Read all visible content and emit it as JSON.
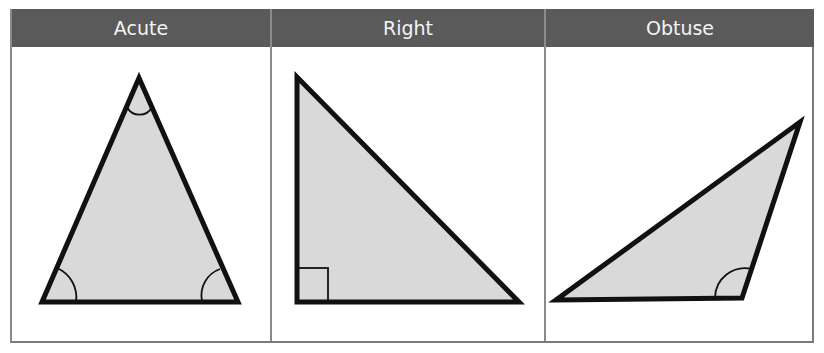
{
  "table": {
    "columns": [
      {
        "label": "Acute"
      },
      {
        "label": "Right"
      },
      {
        "label": "Obtuse"
      }
    ]
  },
  "colors": {
    "header_bg": "#5a5a5a",
    "header_text": "#f4f4f4",
    "triangle_fill": "#d9d9d9",
    "triangle_stroke": "#111111",
    "border": "#8a8a8a"
  },
  "triangles": [
    {
      "name": "acute",
      "vertices": [
        [
          139,
          78
        ],
        [
          42,
          302
        ],
        [
          238,
          302
        ]
      ],
      "angle_marks": [
        "arc at apex",
        "arc at bottom-left",
        "arc at bottom-right"
      ]
    },
    {
      "name": "right",
      "vertices": [
        [
          297,
          77
        ],
        [
          297,
          302
        ],
        [
          519,
          302
        ]
      ],
      "angle_marks": [
        "right-angle square at bottom-left"
      ]
    },
    {
      "name": "obtuse",
      "vertices": [
        [
          556,
          300
        ],
        [
          742,
          298
        ],
        [
          800,
          122
        ]
      ],
      "angle_marks": [
        "arc at obtuse vertex"
      ]
    }
  ]
}
